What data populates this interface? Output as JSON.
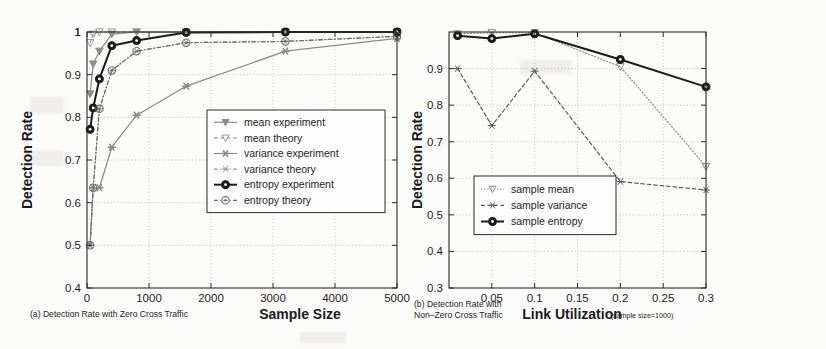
{
  "figure": {
    "background_color": "#fbfbfa",
    "ink_color": "#1c1c1c",
    "gray_series_color": "#7d7d7d"
  },
  "panel_a": {
    "caption": "(a) Detection Rate with Zero Cross Traffic",
    "chart_data": {
      "type": "line",
      "title": "",
      "xlabel": "Sample Size",
      "ylabel": "Detection Rate",
      "xlim": [
        0,
        5000
      ],
      "ylim": [
        0.4,
        1.0
      ],
      "xticks": [
        0,
        1000,
        2000,
        3000,
        4000,
        5000
      ],
      "xticklabels": [
        "0",
        "1000",
        "2000",
        "3000",
        "4000",
        "5000"
      ],
      "yticks": [
        0.4,
        0.5,
        0.6,
        0.7,
        0.8,
        0.9,
        1.0
      ],
      "yticklabels": [
        "0.4",
        "0.5",
        "0.6",
        "0.7",
        "0.8",
        "0.9",
        "1"
      ],
      "grid": true,
      "legend_position": "center-right",
      "series": [
        {
          "name": "mean experiment",
          "marker": "triangle-down-filled",
          "line": "solid",
          "color": "#8a8a8a",
          "x": [
            50,
            100,
            200,
            400,
            800,
            1600,
            3200,
            5000
          ],
          "y": [
            0.855,
            0.925,
            0.955,
            0.995,
            1.0,
            1.0,
            1.0,
            1.0
          ]
        },
        {
          "name": "mean theory",
          "marker": "triangle-down-open",
          "line": "dashed",
          "color": "#9a9a9a",
          "x": [
            50,
            100,
            200,
            400,
            800,
            1600,
            3200,
            5000
          ],
          "y": [
            0.975,
            0.995,
            1.0,
            1.0,
            1.0,
            1.0,
            1.0,
            1.0
          ]
        },
        {
          "name": "variance experiment",
          "marker": "star-filled",
          "line": "solid",
          "color": "#8a8a8a",
          "x": [
            50,
            100,
            200,
            400,
            800,
            1600,
            3200,
            5000
          ],
          "y": [
            0.5,
            0.635,
            0.635,
            0.73,
            0.805,
            0.873,
            0.955,
            0.985
          ]
        },
        {
          "name": "variance theory",
          "marker": "star-open",
          "line": "dash-dot",
          "color": "#9a9a9a",
          "x": [
            50,
            100,
            200,
            400,
            800,
            1600,
            3200,
            5000
          ],
          "y": [
            0.5,
            0.635,
            0.82,
            0.91,
            0.955,
            0.975,
            0.978,
            0.99
          ]
        },
        {
          "name": "entropy experiment",
          "marker": "circle-filled",
          "line": "solid",
          "color": "#1c1c1c",
          "x": [
            50,
            100,
            200,
            400,
            800,
            1600,
            3200,
            5000
          ],
          "y": [
            0.772,
            0.822,
            0.89,
            0.968,
            0.98,
            0.999,
            1.0,
            1.0
          ]
        },
        {
          "name": "entropy theory",
          "marker": "circle-open",
          "line": "dash-dot",
          "color": "#6e6e6e",
          "x": [
            50,
            100,
            200,
            400,
            800,
            1600,
            3200,
            5000
          ],
          "y": [
            0.5,
            0.635,
            0.82,
            0.91,
            0.955,
            0.975,
            0.978,
            0.99
          ]
        }
      ]
    }
  },
  "panel_b": {
    "caption_line1": "(b)  Detection Rate with",
    "caption_line2": "Non–Zero Cross Traffic",
    "note": "(sample size=1000)",
    "chart_data": {
      "type": "line",
      "title": "",
      "xlabel": "Link Utilization",
      "ylabel": "Detection Rate",
      "xlim": [
        0.0,
        0.3
      ],
      "ylim": [
        0.3,
        1.0
      ],
      "xticks": [
        0.05,
        0.1,
        0.15,
        0.2,
        0.25,
        0.3
      ],
      "xticklabels": [
        "0.05",
        "0.1",
        "0.15",
        "0.2",
        "0.25",
        "0.3"
      ],
      "yticks": [
        0.3,
        0.4,
        0.5,
        0.6,
        0.7,
        0.8,
        0.9
      ],
      "yticklabels": [
        "0.3",
        "0.4",
        "0.5",
        "0.6",
        "0.7",
        "0.8",
        "0.9"
      ],
      "grid": true,
      "legend_position": "center-left",
      "series": [
        {
          "name": "sample mean",
          "marker": "triangle-down-open",
          "line": "dotted",
          "color": "#8a8a8a",
          "x": [
            0.01,
            0.05,
            0.1,
            0.2,
            0.3
          ],
          "y": [
            0.995,
            0.998,
            0.998,
            0.905,
            0.632
          ]
        },
        {
          "name": "sample variance",
          "marker": "star-open",
          "line": "dashed",
          "color": "#555555",
          "x": [
            0.01,
            0.05,
            0.1,
            0.2,
            0.3
          ],
          "y": [
            0.9,
            0.744,
            0.893,
            0.591,
            0.568
          ]
        },
        {
          "name": "sample entropy",
          "marker": "circle-filled",
          "line": "solid",
          "color": "#1c1c1c",
          "x": [
            0.01,
            0.05,
            0.1,
            0.2,
            0.3
          ],
          "y": [
            0.99,
            0.982,
            0.995,
            0.925,
            0.85
          ]
        }
      ]
    }
  }
}
